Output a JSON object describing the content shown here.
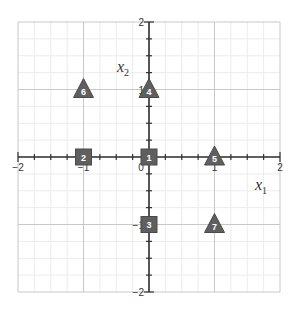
{
  "diagram": {
    "type": "coordinate-plane-points",
    "x_axis": {
      "label": "x",
      "subscript": "1",
      "range": [
        -2,
        2
      ],
      "ticks": [
        "-2",
        "-1",
        "0",
        "1",
        "2"
      ]
    },
    "y_axis": {
      "label": "x",
      "subscript": "2",
      "range": [
        -2,
        2
      ],
      "ticks": [
        "-2",
        "-1",
        "1",
        "2"
      ]
    },
    "origin_label": "0",
    "colors": {
      "marker_fill": "#5f5f5f",
      "marker_stroke": "#4a4a4a",
      "axis": "#333333",
      "major_grid": "#c8c8c8",
      "minor_grid": "#ececec"
    },
    "points": [
      {
        "id": "1",
        "shape": "square",
        "x": 0,
        "y": 0
      },
      {
        "id": "2",
        "shape": "square",
        "x": -1,
        "y": 0
      },
      {
        "id": "3",
        "shape": "square",
        "x": 0,
        "y": -1
      },
      {
        "id": "4",
        "shape": "triangle",
        "x": 0,
        "y": 1
      },
      {
        "id": "5",
        "shape": "triangle",
        "x": 1,
        "y": 0
      },
      {
        "id": "6",
        "shape": "triangle",
        "x": -1,
        "y": 1
      },
      {
        "id": "7",
        "shape": "triangle",
        "x": 1,
        "y": -1
      }
    ]
  }
}
